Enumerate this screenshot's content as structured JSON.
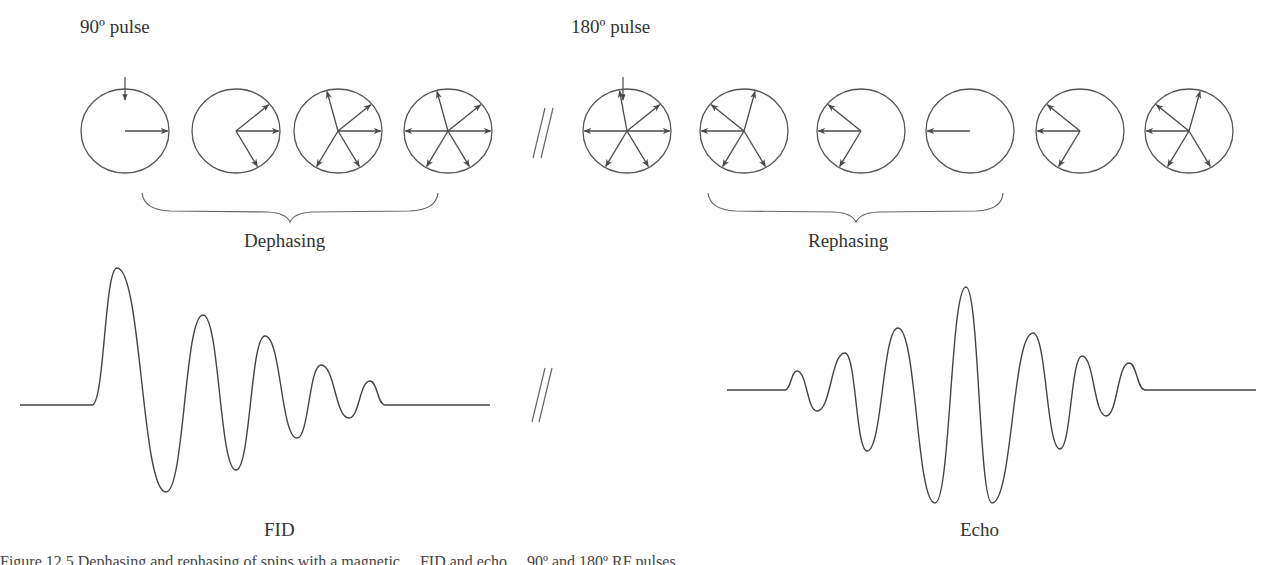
{
  "labels": {
    "pulse90": "90º pulse",
    "pulse180": "180º pulse",
    "dephasing": "Dephasing",
    "rephasing": "Rephasing",
    "fid": "FID",
    "echo": "Echo",
    "caption_clipped": "Figure 12.5  Dephasing and rephasing of spins with a magnetic ... FID and echo ... 90º and 180º RF pulses."
  },
  "colors": {
    "stroke": "#555555",
    "arrow": "#4a4a4a",
    "text": "#333333"
  },
  "spin_diagrams": [
    {
      "id": "c1",
      "cx": 125,
      "angles": [
        0
      ]
    },
    {
      "id": "c2",
      "cx": 236,
      "angles": [
        0,
        40,
        -60
      ]
    },
    {
      "id": "c3",
      "cx": 338,
      "angles": [
        0,
        40,
        105,
        -60,
        -120
      ]
    },
    {
      "id": "c4",
      "cx": 448,
      "angles": [
        0,
        40,
        105,
        180,
        -60,
        -120
      ]
    },
    {
      "id": "c5",
      "cx": 627,
      "angles": [
        0,
        40,
        100,
        180,
        -60,
        -120
      ]
    },
    {
      "id": "c6",
      "cx": 744,
      "angles": [
        180,
        140,
        75,
        -120,
        -60
      ]
    },
    {
      "id": "c7",
      "cx": 861,
      "angles": [
        180,
        140,
        -120
      ]
    },
    {
      "id": "c8",
      "cx": 970,
      "angles": [
        180
      ]
    },
    {
      "id": "c9",
      "cx": 1080,
      "angles": [
        180,
        140,
        -120
      ]
    },
    {
      "id": "c10",
      "cx": 1189,
      "angles": [
        180,
        140,
        75,
        -120,
        -60
      ]
    }
  ],
  "chart_data": [
    {
      "type": "line",
      "title": "FID",
      "description": "Free induction decay: damped oscillation starting with large positive lobe after 90º pulse",
      "baseline_y": 405,
      "peaks": [
        {
          "x": 117,
          "y": 268,
          "kind": "max"
        },
        {
          "x": 166,
          "y": 492,
          "kind": "min"
        },
        {
          "x": 203,
          "y": 315,
          "kind": "max"
        },
        {
          "x": 236,
          "y": 470,
          "kind": "min"
        },
        {
          "x": 265,
          "y": 336,
          "kind": "max"
        },
        {
          "x": 297,
          "y": 438,
          "kind": "min"
        },
        {
          "x": 321,
          "y": 365,
          "kind": "max"
        },
        {
          "x": 349,
          "y": 418,
          "kind": "min"
        },
        {
          "x": 370,
          "y": 381,
          "kind": "max"
        }
      ],
      "xrange": [
        20,
        490
      ]
    },
    {
      "type": "line",
      "title": "Echo",
      "description": "Spin echo: symmetric growing then decaying oscillation after 180º pulse",
      "baseline_y": 390,
      "peaks": [
        {
          "x": 797,
          "y": 371,
          "kind": "max"
        },
        {
          "x": 817,
          "y": 411,
          "kind": "min"
        },
        {
          "x": 845,
          "y": 353,
          "kind": "max"
        },
        {
          "x": 867,
          "y": 451,
          "kind": "min"
        },
        {
          "x": 898,
          "y": 328,
          "kind": "max"
        },
        {
          "x": 935,
          "y": 503,
          "kind": "min"
        },
        {
          "x": 966,
          "y": 287,
          "kind": "max"
        },
        {
          "x": 992,
          "y": 503,
          "kind": "min"
        },
        {
          "x": 1033,
          "y": 333,
          "kind": "max"
        },
        {
          "x": 1060,
          "y": 449,
          "kind": "min"
        },
        {
          "x": 1082,
          "y": 356,
          "kind": "max"
        },
        {
          "x": 1106,
          "y": 416,
          "kind": "min"
        },
        {
          "x": 1129,
          "y": 363,
          "kind": "max"
        }
      ],
      "xrange": [
        727,
        1256
      ]
    }
  ]
}
